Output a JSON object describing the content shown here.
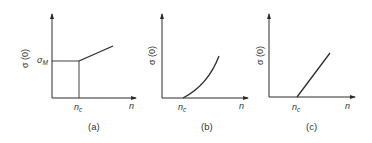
{
  "figure": {
    "panels": [
      {
        "id": "a",
        "caption": "(a)",
        "y_label": "σ (0)",
        "x_label": "n",
        "y_tick_label": "σ",
        "y_tick_sub": "M",
        "x_tick_label": "n",
        "x_tick_sub": "c",
        "description": "Step jump to σ_M at n_c, then linear increase"
      },
      {
        "id": "b",
        "caption": "(b)",
        "y_label": "σ (0)",
        "x_label": "n",
        "x_tick_label": "n",
        "x_tick_sub": "c",
        "description": "Continuous convex rise starting from zero at n_c"
      },
      {
        "id": "c",
        "caption": "(c)",
        "y_label": "σ (0)",
        "x_label": "n",
        "x_tick_label": "n",
        "x_tick_sub": "c",
        "description": "Linear rise starting from zero at n_c"
      }
    ],
    "colors": {
      "line": "#2a2a2a",
      "text": "#333333",
      "background": "#ffffff"
    }
  }
}
